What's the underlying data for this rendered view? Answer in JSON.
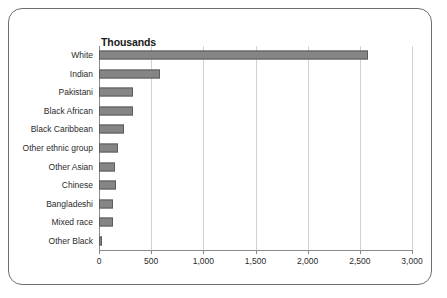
{
  "chart_data": {
    "type": "bar",
    "orientation": "horizontal",
    "title": "Thousands",
    "xlabel": "",
    "ylabel": "",
    "categories": [
      "White",
      "Indian",
      "Pakistani",
      "Black African",
      "Black Caribbean",
      "Other ethnic group",
      "Other Asian",
      "Chinese",
      "Bangladeshi",
      "Mixed race",
      "Other Black"
    ],
    "values": [
      2580,
      585,
      325,
      325,
      240,
      185,
      155,
      165,
      135,
      135,
      25
    ],
    "xlim": [
      0,
      3000
    ],
    "xticks": [
      0,
      500,
      1000,
      1500,
      2000,
      2500,
      3000
    ],
    "xtick_labels": [
      "0",
      "500",
      "1,000",
      "1,500",
      "2,000",
      "2,500",
      "3,000"
    ],
    "grid": true,
    "grid_axis": "x",
    "legend": false,
    "bar_color": "#858585",
    "bar_edge_color": "#5d5d5d",
    "grid_color": "#d2d2d2",
    "axis_color": "#8a8a8a",
    "frame_color": "#6f6f6f",
    "background": "#ffffff"
  }
}
